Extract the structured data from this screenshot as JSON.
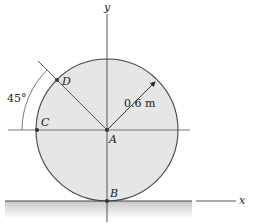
{
  "figure": {
    "type": "mechanics-diagram",
    "axes": {
      "x_label": "x",
      "y_label": "y"
    },
    "points": {
      "A": "A",
      "B": "B",
      "C": "C",
      "D": "D"
    },
    "dimensions": {
      "radius_label": "0.6 m",
      "angle_label": "45°"
    },
    "colors": {
      "disk_fill": "#e6e6e6",
      "line": "#444444",
      "ground_shade": "#cfcfcf",
      "background": "#ffffff"
    }
  }
}
